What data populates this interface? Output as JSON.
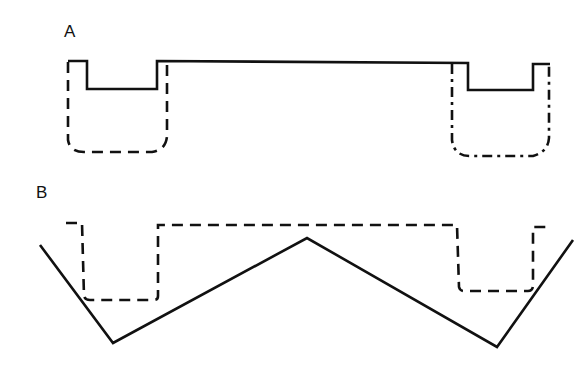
{
  "panels": [
    {
      "label": "A",
      "solid_path": [
        [
          68,
          61
        ],
        [
          87,
          61
        ],
        [
          87,
          89
        ],
        [
          157,
          89
        ],
        [
          157,
          61
        ],
        [
          468,
          63
        ],
        [
          468,
          90
        ],
        [
          533,
          90
        ],
        [
          533,
          64
        ],
        [
          550,
          64
        ]
      ],
      "dashed_left_path": "M68,62 L68,140 Q70,152 84,152 L152,152 Q166,150 167,136 L167,64",
      "dashed_right_path": "M452,64 L452,140 Q454,156 470,156 L533,156 Q548,152 549,138 L549,66"
    },
    {
      "label": "B",
      "solid_path": [
        [
          40,
          245
        ],
        [
          113,
          343
        ],
        [
          307,
          238
        ],
        [
          497,
          347
        ],
        [
          573,
          240
        ]
      ],
      "dashed_path": "M66,223 L82,223 L84,296 Q85,300 90,300 L154,300 Q158,300 158,296 L158,225 L457,225 L459,287 Q460,291 464,291 L528,291 Q533,291 533,285 L533,227 L548,227"
    }
  ],
  "colors": {
    "line": "#111111",
    "background": "#ffffff"
  }
}
